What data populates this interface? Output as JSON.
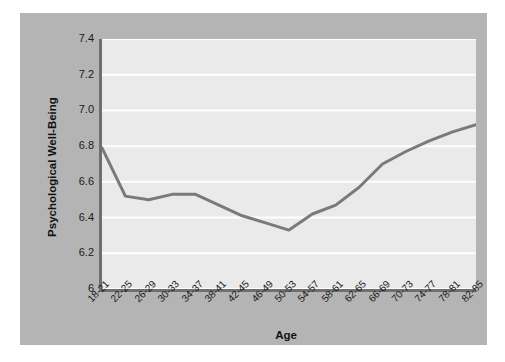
{
  "chart_data": {
    "type": "line",
    "title": "",
    "xlabel": "Age",
    "ylabel": "Psychological Well-Being",
    "categories": [
      "18-21",
      "22-25",
      "26-29",
      "30-33",
      "34-37",
      "38-41",
      "42-45",
      "46-49",
      "50-53",
      "54-57",
      "58-61",
      "62-65",
      "66-69",
      "70-73",
      "74-77",
      "78-81",
      "82-85"
    ],
    "values": [
      6.79,
      6.52,
      6.5,
      6.53,
      6.53,
      6.47,
      6.41,
      6.37,
      6.33,
      6.42,
      6.47,
      6.57,
      6.7,
      6.77,
      6.83,
      6.88,
      6.92
    ],
    "series": [
      {
        "name": "Psychological Well-Being",
        "values": [
          6.79,
          6.52,
          6.5,
          6.53,
          6.53,
          6.47,
          6.41,
          6.37,
          6.33,
          6.42,
          6.47,
          6.57,
          6.7,
          6.77,
          6.83,
          6.88,
          6.92
        ]
      }
    ],
    "ylim": [
      6.0,
      7.4
    ],
    "ytick_values": [
      7.4,
      7.2,
      7.0,
      6.8,
      6.6,
      6.4,
      6.2,
      6.0
    ],
    "ytick_labels": [
      "7.4",
      "7.2",
      "7.0",
      "6.8",
      "6.6",
      "6.4",
      "6.2",
      "6"
    ],
    "grid": true,
    "grid_color": "#ffffff",
    "legend": "none",
    "line_color": "#7a7a7a",
    "line_width": 3,
    "markers": "none",
    "plot_background": "#eaeaea",
    "figure_background": "#b4b4b4",
    "axis_color": "#6f6f6f",
    "text_color": "#1a1a1a"
  }
}
